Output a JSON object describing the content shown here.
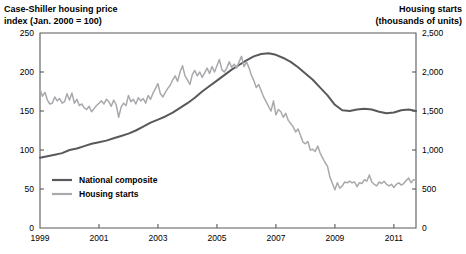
{
  "chart_data": {
    "type": "line",
    "title": "",
    "left_axis": {
      "label": "Case-Shiller housing price index (Jan. 2000 = 100)",
      "label_line1": "Case-Shiller housing price",
      "label_line2": "index (Jan. 2000 = 100)",
      "ticks": [
        0,
        50,
        100,
        150,
        200,
        250
      ],
      "tick_labels": [
        "0",
        "50",
        "100",
        "150",
        "200",
        "250"
      ],
      "ylim": [
        0,
        250
      ],
      "series": "National composite"
    },
    "right_axis": {
      "label": "Housing starts (thousands of units)",
      "label_line1": "Housing starts",
      "label_line2": "(thousands of units)",
      "ticks": [
        0,
        500,
        1000,
        1500,
        2000,
        2500
      ],
      "tick_labels": [
        "0",
        "500",
        "1,000",
        "1,500",
        "2,000",
        "2,500"
      ],
      "ylim": [
        0,
        2500
      ],
      "series": "Housing starts"
    },
    "xlabel": "",
    "xlim": [
      1999.0,
      2011.75
    ],
    "x_ticks": [
      1999,
      2001,
      2003,
      2005,
      2007,
      2009,
      2011
    ],
    "x_tick_labels": [
      "1999",
      "2001",
      "2003",
      "2005",
      "2007",
      "2009",
      "2011"
    ],
    "grid": false,
    "legend_position": "inside-lower-left",
    "series": [
      {
        "name": "National composite",
        "axis": "left",
        "color": "#58595b",
        "width": 2.0,
        "x": [
          1999.0,
          1999.25,
          1999.5,
          1999.75,
          2000.0,
          2000.25,
          2000.5,
          2000.75,
          2001.0,
          2001.25,
          2001.5,
          2001.75,
          2002.0,
          2002.25,
          2002.5,
          2002.75,
          2003.0,
          2003.25,
          2003.5,
          2003.75,
          2004.0,
          2004.25,
          2004.5,
          2004.75,
          2005.0,
          2005.25,
          2005.5,
          2005.75,
          2006.0,
          2006.25,
          2006.5,
          2006.75,
          2007.0,
          2007.25,
          2007.5,
          2007.75,
          2008.0,
          2008.25,
          2008.5,
          2008.75,
          2009.0,
          2009.25,
          2009.5,
          2009.75,
          2010.0,
          2010.25,
          2010.5,
          2010.75,
          2011.0,
          2011.25,
          2011.5,
          2011.75
        ],
        "values": [
          90,
          92,
          94,
          96,
          100,
          102,
          105,
          108,
          110,
          112,
          115,
          118,
          121,
          125,
          130,
          135,
          139,
          143,
          148,
          154,
          160,
          167,
          175,
          182,
          189,
          196,
          203,
          209,
          215,
          220,
          223,
          224,
          222,
          218,
          213,
          206,
          198,
          190,
          180,
          170,
          158,
          151,
          150,
          152,
          153,
          152,
          149,
          147,
          148,
          151,
          152,
          150
        ]
      },
      {
        "name": "Housing starts",
        "axis": "right",
        "color": "#a7a9ac",
        "width": 1.5,
        "x": [
          1999.0,
          1999.083,
          1999.167,
          1999.25,
          1999.333,
          1999.417,
          1999.5,
          1999.583,
          1999.667,
          1999.75,
          1999.833,
          1999.917,
          2000.0,
          2000.083,
          2000.167,
          2000.25,
          2000.333,
          2000.417,
          2000.5,
          2000.583,
          2000.667,
          2000.75,
          2000.833,
          2000.917,
          2001.0,
          2001.083,
          2001.167,
          2001.25,
          2001.333,
          2001.417,
          2001.5,
          2001.583,
          2001.667,
          2001.75,
          2001.833,
          2001.917,
          2002.0,
          2002.083,
          2002.167,
          2002.25,
          2002.333,
          2002.417,
          2002.5,
          2002.583,
          2002.667,
          2002.75,
          2002.833,
          2002.917,
          2003.0,
          2003.083,
          2003.167,
          2003.25,
          2003.333,
          2003.417,
          2003.5,
          2003.583,
          2003.667,
          2003.75,
          2003.833,
          2003.917,
          2004.0,
          2004.083,
          2004.167,
          2004.25,
          2004.333,
          2004.417,
          2004.5,
          2004.583,
          2004.667,
          2004.75,
          2004.833,
          2004.917,
          2005.0,
          2005.083,
          2005.167,
          2005.25,
          2005.333,
          2005.417,
          2005.5,
          2005.583,
          2005.667,
          2005.75,
          2005.833,
          2005.917,
          2006.0,
          2006.083,
          2006.167,
          2006.25,
          2006.333,
          2006.417,
          2006.5,
          2006.583,
          2006.667,
          2006.75,
          2006.833,
          2006.917,
          2007.0,
          2007.083,
          2007.167,
          2007.25,
          2007.333,
          2007.417,
          2007.5,
          2007.583,
          2007.667,
          2007.75,
          2007.833,
          2007.917,
          2008.0,
          2008.083,
          2008.167,
          2008.25,
          2008.333,
          2008.417,
          2008.5,
          2008.583,
          2008.667,
          2008.75,
          2008.833,
          2008.917,
          2009.0,
          2009.083,
          2009.167,
          2009.25,
          2009.333,
          2009.417,
          2009.5,
          2009.583,
          2009.667,
          2009.75,
          2009.833,
          2009.917,
          2010.0,
          2010.083,
          2010.167,
          2010.25,
          2010.333,
          2010.417,
          2010.5,
          2010.583,
          2010.667,
          2010.75,
          2010.833,
          2010.917,
          2011.0,
          2011.083,
          2011.167,
          2011.25,
          2011.333,
          2011.417,
          2011.5,
          2011.583,
          2011.667,
          2011.75
        ],
        "values": [
          1780,
          1690,
          1740,
          1640,
          1590,
          1600,
          1680,
          1630,
          1660,
          1600,
          1620,
          1720,
          1640,
          1730,
          1600,
          1650,
          1570,
          1590,
          1540,
          1520,
          1560,
          1490,
          1530,
          1570,
          1600,
          1630,
          1590,
          1650,
          1620,
          1560,
          1640,
          1580,
          1420,
          1550,
          1600,
          1570,
          1700,
          1620,
          1650,
          1590,
          1670,
          1630,
          1660,
          1600,
          1700,
          1650,
          1730,
          1790,
          1850,
          1720,
          1680,
          1740,
          1790,
          1830,
          1900,
          1950,
          1880,
          2000,
          2080,
          1950,
          1900,
          1840,
          1970,
          2020,
          1950,
          2000,
          1930,
          1990,
          2050,
          1980,
          2070,
          2000,
          2080,
          2160,
          2030,
          2000,
          2050,
          2130,
          2060,
          2100,
          2050,
          2130,
          2200,
          2070,
          2130,
          2060,
          1960,
          1890,
          1800,
          1840,
          1760,
          1680,
          1620,
          1560,
          1500,
          1630,
          1450,
          1520,
          1490,
          1420,
          1470,
          1380,
          1340,
          1300,
          1230,
          1270,
          1190,
          1100,
          1080,
          1110,
          1000,
          1010,
          980,
          1050,
          960,
          900,
          840,
          790,
          650,
          570,
          490,
          580,
          510,
          540,
          590,
          580,
          600,
          580,
          590,
          530,
          580,
          570,
          620,
          600,
          680,
          590,
          560,
          540,
          590,
          570,
          600,
          560,
          540,
          560,
          520,
          560,
          580,
          550,
          570,
          610,
          640,
          580,
          620,
          610
        ]
      }
    ],
    "legend": [
      {
        "label": "National composite",
        "color": "#58595b",
        "width": 2.0
      },
      {
        "label": "Housing starts",
        "color": "#a7a9ac",
        "width": 2.0
      }
    ]
  },
  "layout": {
    "plot": {
      "left": 40,
      "right": 416,
      "top": 33,
      "bottom": 228
    },
    "legend": {
      "x": 52,
      "y": 180,
      "row_gap": 14,
      "swatch_len": 20,
      "text_gap": 7
    }
  }
}
